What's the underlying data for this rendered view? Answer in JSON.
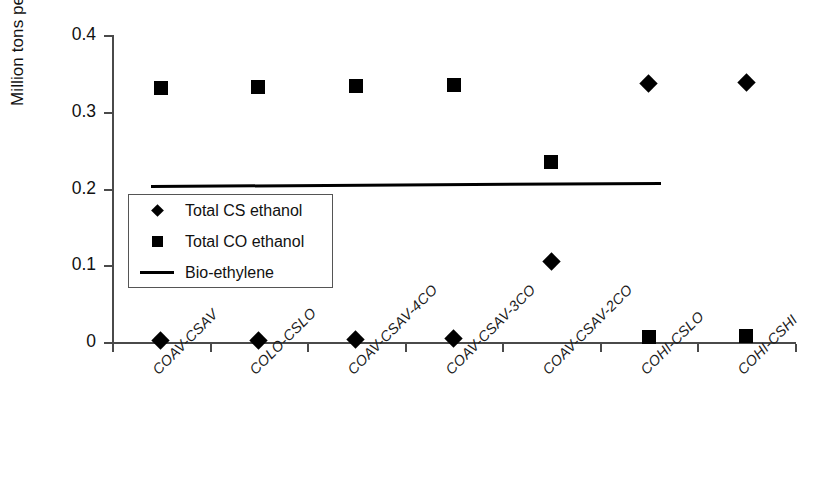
{
  "chart_data": {
    "type": "scatter",
    "title": "",
    "xlabel": "",
    "ylabel": "Million tons per year",
    "ylim": [
      0,
      0.4
    ],
    "yticks": [
      "0",
      "0.1",
      "0.2",
      "0.3",
      "0.4"
    ],
    "ytick_values": [
      0,
      0.1,
      0.2,
      0.3,
      0.4
    ],
    "grid": false,
    "legend_position": "inside-left",
    "categories": [
      "COAV-CSAV",
      "COLO-CSLO",
      "COAV-CSAV-4CO",
      "COAV-CSAV-3CO",
      "COAV-CSAV-2CO",
      "COHI-CSLO",
      "COHI-CSHI"
    ],
    "series": [
      {
        "name": "Total CS ethanol",
        "marker": "diamond",
        "color": "#000000",
        "values": [
          0.002,
          0.002,
          0.003,
          0.004,
          0.105,
          0.337,
          0.338
        ]
      },
      {
        "name": "Total CO ethanol",
        "marker": "square",
        "color": "#000000",
        "values": [
          0.331,
          0.332,
          0.334,
          0.335,
          0.234,
          0.007,
          0.008
        ]
      },
      {
        "name": "Bio-ethylene",
        "marker": "line",
        "color": "#000000",
        "values": [
          0.204,
          0.205,
          0.205,
          0.206,
          0.206,
          0.207,
          0.208
        ]
      }
    ],
    "legend": [
      {
        "label": "Total CS ethanol",
        "key": "diamond-marker-icon"
      },
      {
        "label": "Total CO ethanol",
        "key": "square-marker-icon"
      },
      {
        "label": "Bio-ethylene",
        "key": "line-marker-icon"
      }
    ]
  }
}
